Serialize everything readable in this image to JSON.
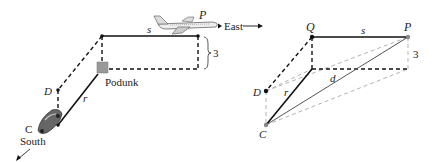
{
  "left_diagram": {
    "labels": {
      "P": "P",
      "east": "East",
      "s": "s",
      "three": "3",
      "podunk": "Podunk",
      "D": "D",
      "r": "r",
      "C": "C",
      "south": "South"
    }
  },
  "right_diagram": {
    "labels": {
      "Q": "Q",
      "P": "P",
      "s": "s",
      "three": "3",
      "d": "d",
      "D": "D",
      "r": "r",
      "C": "C"
    }
  },
  "colors": {
    "line": "#111111",
    "light_line": "#aaaaaa",
    "podunk_square": "#999999",
    "grey_point": "#888888"
  }
}
